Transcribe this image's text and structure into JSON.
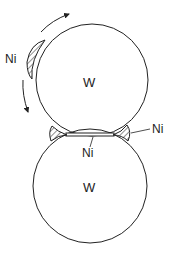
{
  "diagram": {
    "particles": [
      {
        "label": "W",
        "cx": 92,
        "cy": 80,
        "r": 56
      },
      {
        "label": "W",
        "cx": 90,
        "cy": 186,
        "r": 57
      }
    ],
    "labels": {
      "ni_left": "Ni",
      "ni_right": "Ni",
      "ni_neck": "Ni",
      "w_top": "W",
      "w_bottom": "W"
    },
    "colors": {
      "stroke": "#222222",
      "background": "#ffffff"
    }
  }
}
